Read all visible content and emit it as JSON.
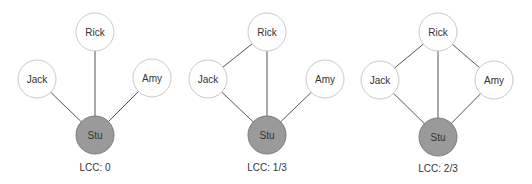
{
  "colors": {
    "node_fill": "#ffffff",
    "node_stroke": "#c8c8c8",
    "center_fill": "#9a9a9a",
    "center_stroke": "#7a7a7a",
    "edge": "#555555",
    "text": "#333333"
  },
  "panels": [
    {
      "lcc_label": "LCC: 0",
      "nodes": {
        "rick": {
          "label": "Rick",
          "x": 95,
          "y": 32
        },
        "jack": {
          "label": "Jack",
          "x": 37,
          "y": 79
        },
        "amy": {
          "label": "Amy",
          "x": 152,
          "y": 78
        },
        "stu": {
          "label": "Stu",
          "x": 95,
          "y": 135
        }
      },
      "edges": [
        [
          "stu",
          "rick"
        ],
        [
          "stu",
          "jack"
        ],
        [
          "stu",
          "amy"
        ]
      ],
      "label_x": 95
    },
    {
      "lcc_label": "LCC: 1/3",
      "nodes": {
        "rick": {
          "label": "Rick",
          "x": 267,
          "y": 32
        },
        "jack": {
          "label": "Jack",
          "x": 208,
          "y": 79
        },
        "amy": {
          "label": "Amy",
          "x": 325,
          "y": 79
        },
        "stu": {
          "label": "Stu",
          "x": 267,
          "y": 135
        }
      },
      "edges": [
        [
          "stu",
          "rick"
        ],
        [
          "stu",
          "jack"
        ],
        [
          "stu",
          "amy"
        ],
        [
          "rick",
          "jack"
        ]
      ],
      "label_x": 267
    },
    {
      "lcc_label": "LCC: 2/3",
      "nodes": {
        "rick": {
          "label": "Rick",
          "x": 438,
          "y": 32
        },
        "jack": {
          "label": "Jack",
          "x": 380,
          "y": 80
        },
        "amy": {
          "label": "Amy",
          "x": 494,
          "y": 80
        },
        "stu": {
          "label": "Stu",
          "x": 438,
          "y": 137
        }
      },
      "edges": [
        [
          "stu",
          "rick"
        ],
        [
          "stu",
          "jack"
        ],
        [
          "stu",
          "amy"
        ],
        [
          "rick",
          "jack"
        ],
        [
          "rick",
          "amy"
        ]
      ],
      "label_x": 438
    }
  ]
}
